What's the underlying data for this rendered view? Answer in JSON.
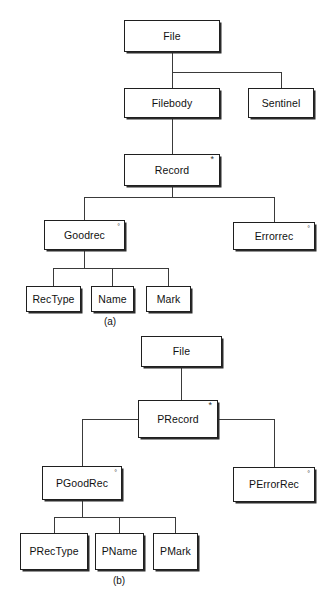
{
  "figure": {
    "background_color": "#ffffff",
    "line_color": "#3a3a3a",
    "box_border_color": "#1f1f1f",
    "text_color": "#111111"
  },
  "diagram_a": {
    "caption": "(a)",
    "nodes": [
      {
        "id": "a-file",
        "label": "File",
        "marker": ""
      },
      {
        "id": "a-filebody",
        "label": "Filebody",
        "marker": ""
      },
      {
        "id": "a-sentinel",
        "label": "Sentinel",
        "marker": ""
      },
      {
        "id": "a-record",
        "label": "Record",
        "marker": "*"
      },
      {
        "id": "a-goodrec",
        "label": "Goodrec",
        "marker": "°"
      },
      {
        "id": "a-errorrec",
        "label": "Errorrec",
        "marker": "°"
      },
      {
        "id": "a-rectype",
        "label": "RecType",
        "marker": ""
      },
      {
        "id": "a-name",
        "label": "Name",
        "marker": ""
      },
      {
        "id": "a-mark",
        "label": "Mark",
        "marker": ""
      }
    ],
    "edges": [
      {
        "from": "a-file",
        "to": "a-filebody"
      },
      {
        "from": "a-file",
        "to": "a-sentinel"
      },
      {
        "from": "a-filebody",
        "to": "a-record"
      },
      {
        "from": "a-record",
        "to": "a-goodrec"
      },
      {
        "from": "a-record",
        "to": "a-errorrec"
      },
      {
        "from": "a-goodrec",
        "to": "a-rectype"
      },
      {
        "from": "a-goodrec",
        "to": "a-name"
      },
      {
        "from": "a-goodrec",
        "to": "a-mark"
      }
    ]
  },
  "diagram_b": {
    "caption": "(b)",
    "nodes": [
      {
        "id": "b-file",
        "label": "File",
        "marker": ""
      },
      {
        "id": "b-precord",
        "label": "PRecord",
        "marker": "*"
      },
      {
        "id": "b-pgoodrec",
        "label": "PGoodRec",
        "marker": "°"
      },
      {
        "id": "b-perrorrec",
        "label": "PErrorRec",
        "marker": "°"
      },
      {
        "id": "b-prectype",
        "label": "PRecType",
        "marker": ""
      },
      {
        "id": "b-pname",
        "label": "PName",
        "marker": ""
      },
      {
        "id": "b-pmark",
        "label": "PMark",
        "marker": ""
      }
    ],
    "edges": [
      {
        "from": "b-file",
        "to": "b-precord"
      },
      {
        "from": "b-precord",
        "to": "b-pgoodrec"
      },
      {
        "from": "b-precord",
        "to": "b-perrorrec"
      },
      {
        "from": "b-pgoodrec",
        "to": "b-prectype"
      },
      {
        "from": "b-pgoodrec",
        "to": "b-pname"
      },
      {
        "from": "b-pgoodrec",
        "to": "b-pmark"
      }
    ]
  },
  "markers_legend": {
    "iteration": "*",
    "selection": "°"
  }
}
